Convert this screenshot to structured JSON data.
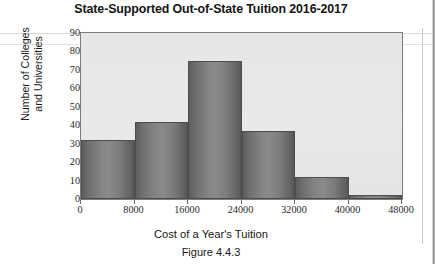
{
  "chart_data": {
    "type": "bar",
    "title": "State-Supported Out-of-State Tuition 2016-2017",
    "xlabel": "Cost of a Year's Tuition",
    "ylabel_line1": "Number of Colleges",
    "ylabel_line2": "and Universities",
    "caption": "Figure 4.4.3",
    "categories": [
      "0-8000",
      "8000-16000",
      "16000-24000",
      "24000-32000",
      "32000-40000",
      "40000-48000"
    ],
    "bin_edges": [
      0,
      8000,
      16000,
      24000,
      32000,
      40000,
      48000
    ],
    "values": [
      32,
      42,
      75,
      37,
      12,
      2
    ],
    "xlim": [
      0,
      48000
    ],
    "ylim": [
      0,
      90
    ],
    "xticks": [
      "0",
      "8000",
      "16000",
      "24000",
      "32000",
      "40000",
      "48000"
    ],
    "xtick_values": [
      0,
      8000,
      16000,
      24000,
      32000,
      40000,
      48000
    ],
    "yticks": [
      "0",
      "10",
      "20",
      "30",
      "40",
      "50",
      "60",
      "70",
      "80",
      "90"
    ],
    "ytick_values": [
      0,
      10,
      20,
      30,
      40,
      50,
      60,
      70,
      80,
      90
    ],
    "grid": false,
    "legend": false,
    "colors": {
      "bar_fill_light": "#8a8a8a",
      "bar_fill_dark": "#565656",
      "bar_border": "#4d4d4d",
      "plot_background": "#e8e8e8",
      "axis": "#7c7c7c",
      "text": "#1a1a1a"
    }
  }
}
